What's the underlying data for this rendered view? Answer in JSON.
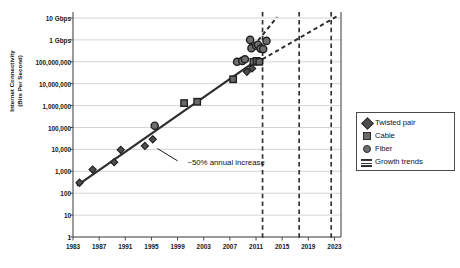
{
  "chart_data": {
    "type": "scatter",
    "title": "",
    "subtitle": "",
    "xlabel": "",
    "ylabel": "Internet Connectivity\n(Bits Per Second)",
    "xlim": [
      1983,
      2024
    ],
    "ylim": [
      1,
      10000000000
    ],
    "y_scale": "log",
    "grid": true,
    "legend_position": "right",
    "x_ticks": [
      "1983",
      "1987",
      "1991",
      "1995",
      "1999",
      "2003",
      "2007",
      "2011",
      "2015",
      "2019",
      "2023"
    ],
    "x_tick_values": [
      1983,
      1987,
      1991,
      1995,
      1999,
      2003,
      2007,
      2011,
      2015,
      2019,
      2023
    ],
    "y_ticks": [
      "1",
      "10",
      "100",
      "1,000",
      "10,000",
      "100,000",
      "1,000,000",
      "10,000,000",
      "100,000,000",
      "1 Gbps",
      "10 Gbps"
    ],
    "y_tick_values": [
      1,
      10,
      100,
      1000,
      10000,
      100000,
      1000000,
      10000000,
      100000000,
      1000000000,
      10000000000
    ],
    "series": [
      {
        "name": "Twisted pair",
        "marker": "diamond",
        "color": "#4d4d4d",
        "points": [
          {
            "x": 1984.0,
            "y": 300
          },
          {
            "x": 1986.0,
            "y": 1200
          },
          {
            "x": 1989.3,
            "y": 2600
          },
          {
            "x": 1990.3,
            "y": 9600
          },
          {
            "x": 1994.0,
            "y": 14400
          },
          {
            "x": 1995.2,
            "y": 28800
          },
          {
            "x": 2009.6,
            "y": 35000000
          },
          {
            "x": 2010.4,
            "y": 50000000
          }
        ]
      },
      {
        "name": "Cable",
        "marker": "square",
        "color": "#6a6a6a",
        "points": [
          {
            "x": 2000.0,
            "y": 1300000
          },
          {
            "x": 2002.0,
            "y": 1500000
          },
          {
            "x": 2007.5,
            "y": 16000000
          },
          {
            "x": 2010.6,
            "y": 100000000
          },
          {
            "x": 2011.1,
            "y": 110000000
          },
          {
            "x": 2011.5,
            "y": 100000000
          }
        ]
      },
      {
        "name": "Fiber",
        "marker": "circle",
        "color": "#6f6f6f",
        "points": [
          {
            "x": 1995.5,
            "y": 120000
          },
          {
            "x": 2008.1,
            "y": 100000000
          },
          {
            "x": 2008.9,
            "y": 110000000
          },
          {
            "x": 2009.3,
            "y": 130000000
          },
          {
            "x": 2010.1,
            "y": 1000000000
          },
          {
            "x": 2010.3,
            "y": 420000000
          },
          {
            "x": 2011.0,
            "y": 540000000
          },
          {
            "x": 2011.3,
            "y": 600000000
          },
          {
            "x": 2011.7,
            "y": 400000000
          },
          {
            "x": 2012.1,
            "y": 380000000
          },
          {
            "x": 2012.6,
            "y": 900000000
          }
        ]
      }
    ],
    "trends": [
      {
        "name": "Growth trends",
        "style": "solid",
        "from": {
          "x": 1983.6,
          "y": 220
        },
        "to": {
          "x": 2011.3,
          "y": 130000000
        }
      },
      {
        "name": "Growth trends",
        "style": "dashed",
        "from": {
          "x": 2010.0,
          "y": 60000000
        },
        "to": {
          "x": 2023.4,
          "y": 12000000000
        }
      },
      {
        "name": "Growth trends",
        "style": "dashed",
        "from": {
          "x": 2010.6,
          "y": 500000000
        },
        "to": {
          "x": 2014.2,
          "y": 11000000000
        }
      }
    ],
    "markers_vertical": [
      {
        "x": 2012.0,
        "style": "dashed"
      },
      {
        "x": 2017.6,
        "style": "dashed"
      },
      {
        "x": 2022.5,
        "style": "dashed"
      }
    ],
    "annotations": [
      {
        "text": "~50% annual increase",
        "x": 2000.5,
        "y": 2400,
        "leader_from": {
          "x": 1999.0,
          "y": 3000
        },
        "leader_to": {
          "x": 1995.9,
          "y": 11000
        }
      }
    ],
    "legend_entries": [
      {
        "label": "Twisted pair",
        "marker": "diamond"
      },
      {
        "label": "Cable",
        "marker": "square"
      },
      {
        "label": "Fiber",
        "marker": "circle"
      },
      {
        "label": "Growth trends",
        "marker": "line"
      }
    ],
    "colors": {
      "axis": "#4a4a4a",
      "grid": "#c9c9c9",
      "trend_solid": "#2e2e2e",
      "trend_dashed": "#2e2e2e",
      "vertical_marker": "#333333",
      "background": "#ffffff"
    }
  }
}
